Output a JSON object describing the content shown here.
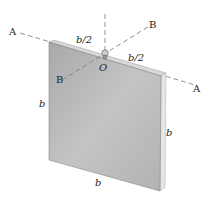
{
  "diagram": {
    "labels": {
      "axis_a_left": "A",
      "axis_a_right": "A",
      "axis_b_top": "B",
      "axis_b_bottom": "B",
      "origin": "O",
      "half_left": "b/2",
      "half_right": "b/2",
      "side_left": "b",
      "side_right": "b",
      "side_bottom": "b"
    },
    "colors": {
      "plate_face": "#b9b9b9",
      "plate_edge": "#e2e2e2",
      "axis_line": "#666666",
      "text": "#222222"
    }
  }
}
